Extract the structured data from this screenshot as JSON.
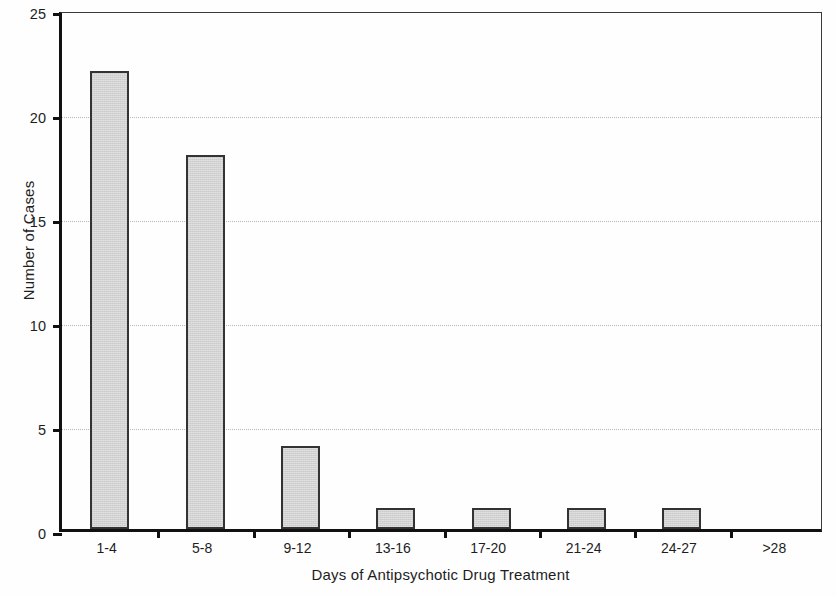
{
  "chart_data": {
    "type": "bar",
    "title": "",
    "subtitle": "",
    "xlabel": "Days of Antipsychotic Drug Treatment",
    "ylabel": "Number of Cases",
    "categories": [
      "1-4",
      "5-8",
      "9-12",
      "13-16",
      "17-20",
      "21-24",
      "24-27",
      ">28"
    ],
    "values": [
      22,
      18,
      4,
      1,
      1,
      1,
      1,
      0
    ],
    "ylim": [
      0,
      25
    ],
    "yticks": [
      0,
      5,
      10,
      15,
      20,
      25
    ],
    "ytick_labels": [
      "0",
      "5",
      "10",
      "15",
      "20",
      "25"
    ],
    "grid": true,
    "grid_axis": "y",
    "grid_style": "dotted",
    "legend": null,
    "legend_position": "none",
    "bar_fill_color": "#d2d2d2",
    "bar_edge_color": "#333333",
    "axis_color": "#111111",
    "grid_color": "#b9b9b9",
    "background_color": "#ffffff",
    "annotations": []
  }
}
